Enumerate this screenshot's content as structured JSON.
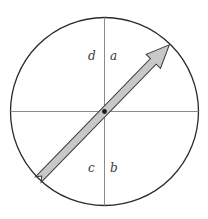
{
  "diagram": {
    "type": "circle-quadrants-with-arrow",
    "quadrant_labels": {
      "upper_left": "d",
      "upper_right": "a",
      "lower_left": "c",
      "lower_right": "b"
    },
    "colors": {
      "circle_stroke": "#2a2a2a",
      "axis_stroke": "#8a8a8a",
      "arrow_fill": "#c8c8c8",
      "arrow_stroke": "#3a3a3a",
      "pivot_dot": "#1a1a1a",
      "label_color": "#3a3a3a"
    }
  }
}
